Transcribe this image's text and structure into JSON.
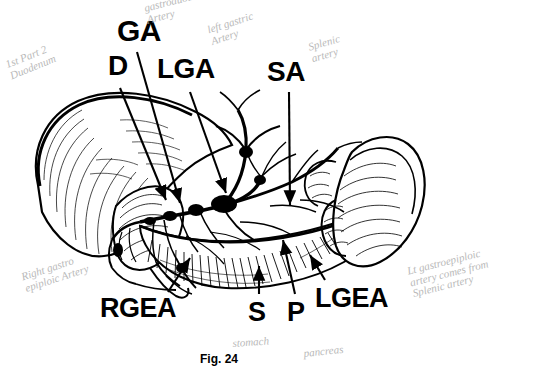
{
  "figure": {
    "caption": "Fig. 24",
    "background_color": "#ffffff",
    "ink_color": "#000000",
    "pencil_color": "#b9b9b9"
  },
  "labels": [
    {
      "id": "GA",
      "text": "GA",
      "x": 117,
      "y": 16,
      "size": 30,
      "meaning": "gastroduodenal-artery"
    },
    {
      "id": "D",
      "text": "D",
      "x": 108,
      "y": 52,
      "size": 28,
      "meaning": "duodenum"
    },
    {
      "id": "LGA",
      "text": "LGA",
      "x": 157,
      "y": 55,
      "size": 28,
      "meaning": "left-gastric-artery"
    },
    {
      "id": "SA",
      "text": "SA",
      "x": 267,
      "y": 58,
      "size": 28,
      "meaning": "splenic-artery"
    },
    {
      "id": "RGEA",
      "text": "RGEA",
      "x": 100,
      "y": 295,
      "size": 27,
      "meaning": "right-gastroepiploic-artery"
    },
    {
      "id": "S",
      "text": "S",
      "x": 248,
      "y": 299,
      "size": 27,
      "meaning": "stomach"
    },
    {
      "id": "P",
      "text": "P",
      "x": 287,
      "y": 299,
      "size": 27,
      "meaning": "pancreas"
    },
    {
      "id": "LGEA",
      "text": "LGEA",
      "x": 315,
      "y": 285,
      "size": 27,
      "meaning": "left-gastroepiploic-artery"
    }
  ],
  "annotations": [
    {
      "id": "duodenum-note",
      "text": "1st Part 2\nDuodenum",
      "x": 4,
      "y": 60,
      "size": 11,
      "rotate": -22
    },
    {
      "id": "gda-note",
      "text": "gastroduodenal\nArtery",
      "x": 143,
      "y": 3,
      "size": 11,
      "rotate": -14
    },
    {
      "id": "lga-note",
      "text": "left gastric\nArtery",
      "x": 206,
      "y": 25,
      "size": 11,
      "rotate": -18
    },
    {
      "id": "splenic-note",
      "text": "Splenic\nartery",
      "x": 307,
      "y": 42,
      "size": 11,
      "rotate": -16
    },
    {
      "id": "rgea-note",
      "text": "Right gastro\nepiploic Artery",
      "x": 20,
      "y": 272,
      "size": 11,
      "rotate": -18
    },
    {
      "id": "lgea-note",
      "text": "Lt gastroepiploic\nartery comes from\nSplenic artery",
      "x": 406,
      "y": 266,
      "size": 11,
      "rotate": -14
    },
    {
      "id": "stomach-note",
      "text": "stomach",
      "x": 232,
      "y": 338,
      "size": 11,
      "rotate": -4
    },
    {
      "id": "pancreas-note",
      "text": "pancreas",
      "x": 303,
      "y": 348,
      "size": 11,
      "rotate": -6
    }
  ],
  "arrows": [
    {
      "id": "arrow-GA",
      "x1": 137,
      "y1": 52,
      "x2": 180,
      "y2": 203
    },
    {
      "id": "arrow-D",
      "x1": 120,
      "y1": 88,
      "x2": 166,
      "y2": 200
    },
    {
      "id": "arrow-LGA",
      "x1": 190,
      "y1": 92,
      "x2": 226,
      "y2": 193
    },
    {
      "id": "arrow-SA",
      "x1": 289,
      "y1": 92,
      "x2": 290,
      "y2": 205
    },
    {
      "id": "arrow-RGEA",
      "x1": 168,
      "y1": 292,
      "x2": 190,
      "y2": 258
    },
    {
      "id": "arrow-S",
      "x1": 259,
      "y1": 294,
      "x2": 259,
      "y2": 266
    },
    {
      "id": "arrow-P",
      "x1": 295,
      "y1": 294,
      "x2": 283,
      "y2": 240
    },
    {
      "id": "arrow-LGEA",
      "x1": 325,
      "y1": 280,
      "x2": 310,
      "y2": 255
    }
  ]
}
